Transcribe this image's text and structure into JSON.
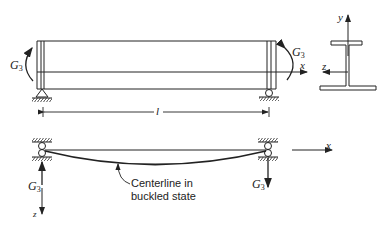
{
  "figure": {
    "top_view": {
      "moment_left": {
        "symbol": "G",
        "subscript": "3"
      },
      "moment_right": {
        "symbol": "G",
        "subscript": "3"
      },
      "axis_x": "x",
      "length_label": "l"
    },
    "cross_section": {
      "axis_y": "y",
      "axis_z": "z",
      "shape": "I-beam (wide bottom flange)"
    },
    "bottom_view": {
      "force_left": {
        "symbol": "G",
        "subscript": "3"
      },
      "force_right": {
        "symbol": "G",
        "subscript": "3"
      },
      "axis_x": "x",
      "axis_z": "z",
      "annotation_line1": "Centerline in",
      "annotation_line2": "buckled state"
    }
  },
  "colors": {
    "ink": "#222222",
    "background": "#ffffff"
  }
}
